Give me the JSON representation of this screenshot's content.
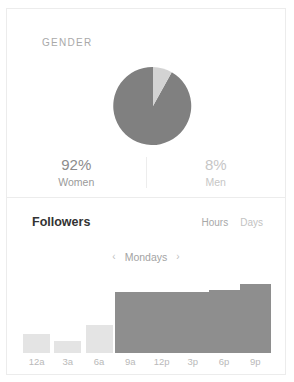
{
  "card": {
    "gender": {
      "label": "GENDER",
      "stats": [
        {
          "value": "92%",
          "name": "Women",
          "emphasis": "primary"
        },
        {
          "value": "8%",
          "name": "Men",
          "emphasis": "secondary"
        }
      ]
    },
    "followers": {
      "title": "Followers",
      "range_options": [
        {
          "label": "Hours",
          "active": true
        },
        {
          "label": "Days",
          "active": false
        }
      ],
      "day_nav": {
        "prev_icon": "‹",
        "label": "Mondays",
        "next_icon": "›"
      }
    }
  },
  "colors": {
    "pie_primary": "#808080",
    "pie_secondary": "#d3d3d3",
    "bar_low": "#e4e4e4",
    "bar_high": "#8e8e8e",
    "card_border": "#ececec",
    "text_dark": "#333333",
    "text_muted": "#a9a9a9"
  },
  "chart_data": [
    {
      "type": "pie",
      "title": "GENDER",
      "labels": [
        "Women",
        "Men"
      ],
      "values": [
        92,
        8
      ],
      "value_labels": [
        "92%",
        "8%"
      ],
      "colors": [
        "#808080",
        "#d3d3d3"
      ],
      "start_angle": 0,
      "legend": "below"
    },
    {
      "type": "bar",
      "title": "Followers",
      "subtitle": "Mondays",
      "categories": [
        "12a",
        "3a",
        "6a",
        "9a",
        "12p",
        "3p",
        "6p",
        "9p"
      ],
      "values": [
        26,
        16,
        38,
        83,
        83,
        83,
        86,
        94
      ],
      "colors": [
        "#e4e4e4",
        "#e4e4e4",
        "#e4e4e4",
        "#8e8e8e",
        "#8e8e8e",
        "#8e8e8e",
        "#8e8e8e",
        "#8e8e8e"
      ],
      "xlabel": "",
      "ylabel": "",
      "ylim": [
        0,
        100
      ],
      "grid": false,
      "legend": "none"
    }
  ]
}
